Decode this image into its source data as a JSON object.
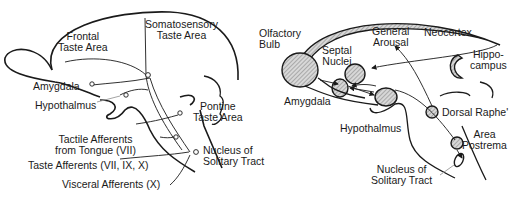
{
  "left_panel": {
    "labels": {
      "frontal_taste_area": [
        "Frontal",
        "Taste Area"
      ],
      "somatosensory_taste_area": [
        "Somatosensory",
        "Taste Area"
      ],
      "amygdala": "Amygdala",
      "hypothalmus": "Hypothalmus",
      "pontine_taste_area": [
        "Pontine",
        "Taste Area"
      ],
      "tactile_afferents": [
        "Tactile Afferents",
        "from Tongue (VII)"
      ],
      "nucleus_solitary_tract": [
        "Nucleus of",
        "Solitary Tract"
      ],
      "taste_afferents": "Taste Afferents  (VII, IX, X)",
      "visceral_afferents": "Visceral Afferents  (X)"
    }
  },
  "right_panel": {
    "labels": {
      "olfactory_bulb": [
        "Olfactory",
        "Bulb"
      ],
      "general_arousal": [
        "General",
        "Arousal"
      ],
      "neocortex": "Neocortex",
      "septal_nuclei": [
        "Septal",
        "Nuclei"
      ],
      "hippocampus": [
        "Hippo-",
        "campus"
      ],
      "amygdala": "Amygdala",
      "hypothalmus": "Hypothalmus",
      "dorsal_raphe": "Dorsal Raphe'",
      "area_postrema": [
        "Area",
        "Postrema"
      ],
      "nucleus_solitary_tract": [
        "Nucleus of",
        "Solitary Tract"
      ]
    }
  },
  "colors": {
    "ink": "#1a1a1a",
    "hatch": "#9a9a9a",
    "background": "#ffffff"
  }
}
